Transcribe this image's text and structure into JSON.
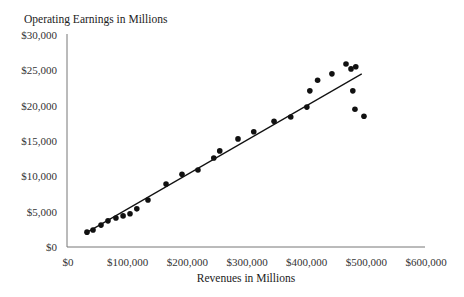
{
  "chart_data": {
    "type": "scatter",
    "title": "",
    "ylabel": "Operating Earnings in Millions",
    "xlabel": "Revenues in Millions",
    "xlim": [
      0,
      600000
    ],
    "ylim": [
      0,
      30000
    ],
    "grid": false,
    "legend": null,
    "x_ticks": [
      0,
      100000,
      200000,
      300000,
      400000,
      500000,
      600000
    ],
    "x_tick_labels": [
      "$0",
      "$100,000",
      "$200,000",
      "$300,000",
      "$400,000",
      "$500,000",
      "$600,000"
    ],
    "y_ticks": [
      0,
      5000,
      10000,
      15000,
      20000,
      25000,
      30000
    ],
    "y_tick_labels": [
      "$0",
      "$5,000",
      "$10,000",
      "$15,000",
      "$20,000",
      "$25,000",
      "$30,000"
    ],
    "series": [
      {
        "name": "Companies",
        "marker": "circle",
        "color": "#111111",
        "points": [
          [
            33500,
            2100
          ],
          [
            43600,
            2400
          ],
          [
            57000,
            3100
          ],
          [
            68700,
            3700
          ],
          [
            82000,
            4100
          ],
          [
            94000,
            4400
          ],
          [
            105600,
            4700
          ],
          [
            117000,
            5400
          ],
          [
            135700,
            6650
          ],
          [
            166000,
            8900
          ],
          [
            192700,
            10300
          ],
          [
            219500,
            10900
          ],
          [
            246000,
            12600
          ],
          [
            256000,
            13600
          ],
          [
            286600,
            15300
          ],
          [
            313000,
            16300
          ],
          [
            347000,
            17800
          ],
          [
            375000,
            18400
          ],
          [
            402000,
            19800
          ],
          [
            407000,
            22100
          ],
          [
            420000,
            23600
          ],
          [
            444000,
            24500
          ],
          [
            467600,
            25900
          ],
          [
            476000,
            25200
          ],
          [
            484000,
            25500
          ],
          [
            479000,
            22100
          ],
          [
            482600,
            19500
          ],
          [
            497700,
            18500
          ]
        ]
      }
    ],
    "trendline": {
      "type": "linear",
      "color": "#111111",
      "from": [
        32000,
        2000
      ],
      "to": [
        494000,
        24500
      ]
    }
  }
}
